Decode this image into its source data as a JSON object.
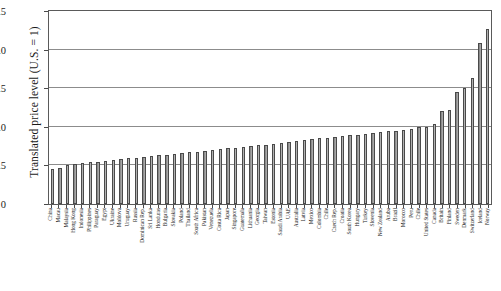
{
  "chart_data": {
    "type": "bar",
    "title": "",
    "xlabel": "",
    "ylabel": "Translated price level (U.S. = 1)",
    "ylim": [
      0,
      2.5
    ],
    "yticks": [
      "0",
      "0.5",
      "1.0",
      "1.5",
      "2.0",
      "2.5"
    ],
    "ytick_values": [
      0,
      0.5,
      1.0,
      1.5,
      2.0,
      2.5
    ],
    "grid": true,
    "legend": "none",
    "categories": [
      "China",
      "Macau",
      "Malaysia",
      "Hong Kong",
      "Indonesia",
      "Philippines",
      "Paraguay",
      "Egypt",
      "Ukraine",
      "Moldova",
      "Uruguay",
      "Russia",
      "Dominican Rep.",
      "Sri Lanka",
      "Honduras",
      "Bulgaria",
      "Slovakia",
      "Poland",
      "Thailand",
      "South Africa",
      "Pakistan",
      "Venezuela",
      "Costa Rica",
      "Japan",
      "Singapore",
      "Guatemala",
      "Lithuania",
      "Georgia",
      "Taiwan",
      "Estonia",
      "Saudi Arabia",
      "UAE",
      "Australia",
      "Latvia",
      "Mexico",
      "Colombia",
      "Chile",
      "Czech Rep.",
      "Croatia",
      "South Korea",
      "Hungary",
      "Turkey",
      "Slovenia",
      "New Zealand",
      "Aruba",
      "Brazil",
      "Morocco",
      "Peru",
      "Chile",
      "United States",
      "Canada",
      "Britain",
      "Finland",
      "Sweden",
      "Denmark",
      "Switzerland",
      "Iceland",
      "Norway"
    ],
    "values": [
      0.45,
      0.47,
      0.5,
      0.52,
      0.53,
      0.54,
      0.55,
      0.56,
      0.57,
      0.58,
      0.59,
      0.6,
      0.61,
      0.62,
      0.63,
      0.64,
      0.65,
      0.66,
      0.67,
      0.68,
      0.69,
      0.7,
      0.71,
      0.72,
      0.73,
      0.74,
      0.75,
      0.76,
      0.77,
      0.78,
      0.79,
      0.8,
      0.82,
      0.83,
      0.84,
      0.85,
      0.86,
      0.87,
      0.88,
      0.89,
      0.9,
      0.91,
      0.92,
      0.93,
      0.94,
      0.95,
      0.96,
      0.97,
      1.0,
      1.0,
      1.03,
      1.2,
      1.22,
      1.45,
      1.5,
      1.63,
      2.08,
      2.27
    ]
  }
}
